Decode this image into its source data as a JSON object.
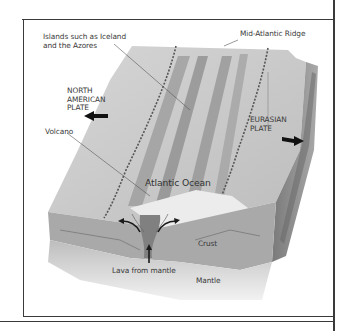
{
  "diagram": {
    "labels": {
      "islands": "Islands such as Iceland\nand the Azores",
      "ridge": "Mid-Atlantic Ridge",
      "north_american_plate": "NORTH\nAMERICAN\nPLATE",
      "eurasian_plate": "EURASIAN\nPLATE",
      "volcano": "Volcano",
      "ocean": "Atlantic Ocean",
      "crust": "Crust",
      "mantle": "Mantle",
      "lava": "Lava from mantle"
    },
    "colors": {
      "seafloor": "#c9c9c9",
      "ridge_band": "#8e8e8e",
      "crust": "#a8a8a8",
      "mantle": "#d8d8d8",
      "side": "#8a8a8a",
      "ocean_surface": "#e4e4e4",
      "arrow": "#1a1a1a",
      "frame": "#3a3a3a"
    }
  }
}
